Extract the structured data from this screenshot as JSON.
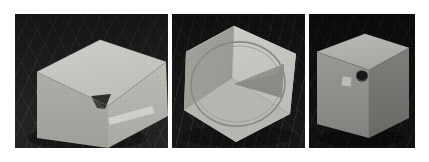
{
  "scene": {
    "title": "Three 3D viewport renders of a gray box on a dark grid floor",
    "background_color": "#ffffff",
    "panel_count": 3,
    "panel_gap_color": "#ffffff"
  },
  "panels": [
    {
      "id": "panel-left",
      "label": "Left viewport",
      "x": 15,
      "y": 14,
      "width": 153,
      "height": 134,
      "floor_color": "#1f1f1f",
      "grid_color": "#3a3a3a",
      "object": {
        "name": "gray-box",
        "shape": "cuboid",
        "orientation": "three-quarter view, top face visible, camera slightly above",
        "top_face_color": "#c9c9c4",
        "left_face_color": "#a9a9a4",
        "right_face_color": "#b5b5b0",
        "features": [
          {
            "name": "triangular-notch",
            "type": "triangle-cutout",
            "color": "#2b2b28",
            "location": "front-right face, upper middle"
          },
          {
            "name": "thin-ledge",
            "type": "sliver-edge",
            "color": "#d2d2cd",
            "location": "lower right edge"
          }
        ]
      }
    },
    {
      "id": "panel-middle",
      "label": "Middle viewport",
      "x": 172,
      "y": 14,
      "width": 133,
      "height": 134,
      "floor_color": "#141414",
      "grid_color": "#3f3f3f",
      "object": {
        "name": "gray-box",
        "shape": "cuboid",
        "orientation": "rotated corner-on, reads as a hexagon silhouette",
        "top_face_color": "#c4c4bf",
        "left_face_color": "#a6a6a1",
        "right_face_color": "#bdbdb8",
        "features": [
          {
            "name": "circle-decal",
            "type": "circle-outline",
            "color": "#8e8e89",
            "location": "centered on the face, large inscribed circle"
          },
          {
            "name": "pie-wedge",
            "type": "triangle-fill",
            "color": "#8c8c87",
            "location": "right of circle center, pointing left"
          }
        ]
      }
    },
    {
      "id": "panel-right",
      "label": "Right viewport",
      "x": 309,
      "y": 14,
      "width": 106,
      "height": 134,
      "floor_color": "#0d0d0d",
      "grid_color": "#353535",
      "object": {
        "name": "gray-box",
        "shape": "tall-cuboid",
        "orientation": "three-quarter view, standing upright, top face visible",
        "top_face_color": "#b4b4b0",
        "left_face_color": "#8f8f8b",
        "right_face_color": "#777773",
        "features": [
          {
            "name": "circular-hole",
            "type": "circle-fill",
            "color": "#151515",
            "location": "upper right of the front-left face"
          },
          {
            "name": "square-patch",
            "type": "square-fill",
            "color": "#bdbdb8",
            "location": "left of the circular hole, slightly lower"
          }
        ]
      }
    }
  ]
}
